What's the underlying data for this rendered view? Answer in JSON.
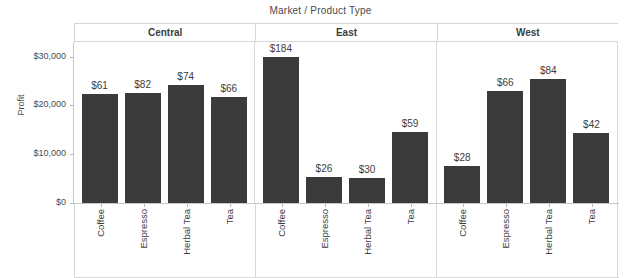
{
  "chart_data": {
    "type": "bar",
    "title": "Market / Product Type",
    "xlabel": "",
    "ylabel": "Profit",
    "ylim": [
      0,
      33000
    ],
    "grid": false,
    "legend": null,
    "y_ticks": [
      {
        "value": 0,
        "label": "$0"
      },
      {
        "value": 10000,
        "label": "$10,000"
      },
      {
        "value": 20000,
        "label": "$20,000"
      },
      {
        "value": 30000,
        "label": "$30,000"
      }
    ],
    "categories": [
      "Coffee",
      "Espresso",
      "Herbal Tea",
      "Tea"
    ],
    "panels": [
      {
        "name": "Central",
        "bars": [
          {
            "category": "Coffee",
            "value": 22400,
            "label": "$61"
          },
          {
            "category": "Espresso",
            "value": 22600,
            "label": "$82"
          },
          {
            "category": "Herbal Tea",
            "value": 24100,
            "label": "$74"
          },
          {
            "category": "Tea",
            "value": 21700,
            "label": "$66"
          }
        ]
      },
      {
        "name": "East",
        "bars": [
          {
            "category": "Coffee",
            "value": 30000,
            "label": "$184"
          },
          {
            "category": "Espresso",
            "value": 5400,
            "label": "$26"
          },
          {
            "category": "Herbal Tea",
            "value": 5200,
            "label": "$30"
          },
          {
            "category": "Tea",
            "value": 14600,
            "label": "$59"
          }
        ]
      },
      {
        "name": "West",
        "bars": [
          {
            "category": "Coffee",
            "value": 7600,
            "label": "$28"
          },
          {
            "category": "Espresso",
            "value": 22900,
            "label": "$66"
          },
          {
            "category": "Herbal Tea",
            "value": 25500,
            "label": "$84"
          },
          {
            "category": "Tea",
            "value": 14400,
            "label": "$42"
          }
        ]
      }
    ],
    "colors": {
      "bar": "#3b3b3b",
      "axis": "#c8c8c8",
      "grid_line": "#d6d6d6",
      "text": "#3d3d3d",
      "background": "#ffffff"
    }
  }
}
